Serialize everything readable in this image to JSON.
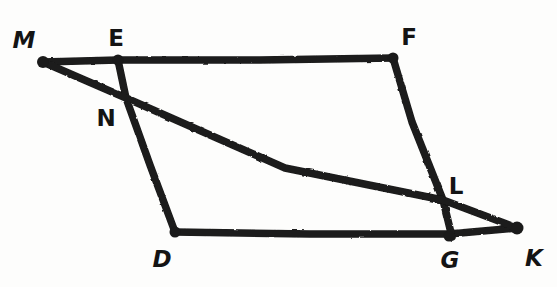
{
  "figure": {
    "background_color": "#fdfdfc",
    "stroke_color": "#1a1a1a",
    "label_color": "#141414",
    "stroke_width": 7,
    "points": {
      "M": {
        "label": "M",
        "x": 43,
        "y": 62,
        "label_x": 24,
        "label_y": 40,
        "style": "slanted",
        "is_vertex": true
      },
      "E": {
        "label": "E",
        "x": 118,
        "y": 60,
        "label_x": 116,
        "label_y": 38,
        "style": "upright",
        "is_vertex": true
      },
      "F": {
        "label": "F",
        "x": 393,
        "y": 58,
        "label_x": 409,
        "label_y": 37,
        "style": "upright",
        "is_vertex": true
      },
      "N": {
        "label": "N",
        "x": 126,
        "y": 98,
        "label_x": 106,
        "label_y": 118,
        "style": "upright",
        "is_vertex": false
      },
      "L": {
        "label": "L",
        "x": 443,
        "y": 200,
        "label_x": 456,
        "label_y": 186,
        "style": "upright",
        "is_vertex": false
      },
      "D": {
        "label": "D",
        "x": 175,
        "y": 232,
        "label_x": 162,
        "label_y": 259,
        "style": "slanted",
        "is_vertex": true
      },
      "G": {
        "label": "G",
        "x": 449,
        "y": 234,
        "label_x": 450,
        "label_y": 260,
        "style": "slanted",
        "is_vertex": true
      },
      "K": {
        "label": "K",
        "x": 517,
        "y": 228,
        "label_x": 534,
        "label_y": 258,
        "style": "slanted",
        "is_vertex": true
      }
    },
    "segments": [
      {
        "name": "segment-M-F-top",
        "from": "M",
        "to": "F",
        "via": "E",
        "description": "top edge through E"
      },
      {
        "name": "segment-E-D-left",
        "from": "E",
        "to": "D",
        "via": "N",
        "description": "left slanted edge through N"
      },
      {
        "name": "segment-F-G-right",
        "from": "F",
        "to": "G",
        "via": "L",
        "description": "right slanted edge through L"
      },
      {
        "name": "segment-D-K-bottom",
        "from": "D",
        "to": "K",
        "via": "G",
        "description": "bottom edge through G"
      },
      {
        "name": "segment-M-K-diagonal",
        "from": "M",
        "to": "K",
        "via": "N",
        "description": "long diagonal crossing at N and L"
      }
    ],
    "dots": [
      "M",
      "E",
      "F",
      "D",
      "G",
      "K"
    ],
    "label_order": [
      "M",
      "E",
      "F",
      "N",
      "L",
      "D",
      "G",
      "K"
    ]
  }
}
